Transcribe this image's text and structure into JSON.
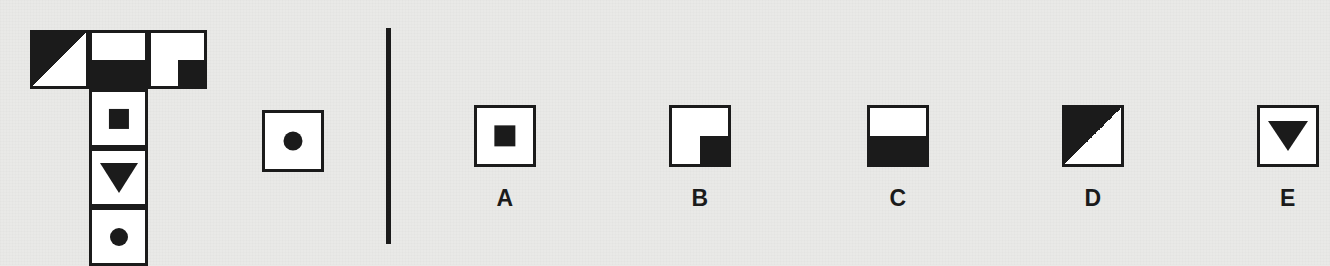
{
  "puzzle": {
    "type": "visual-analogy-matrix",
    "background_color": "#e9e9e7",
    "ink_color": "#1b1b1b",
    "matrix": {
      "shape": "T",
      "top_row": [
        {
          "id": "m-r1c1",
          "fill": "triangle-lower-left",
          "label": "black triangle lower-left"
        },
        {
          "id": "m-r1c2",
          "fill": "bottom-half",
          "label": "bottom half black"
        },
        {
          "id": "m-r1c3",
          "fill": "quadrant-bottom-right",
          "label": "black square bottom-right quadrant"
        }
      ],
      "column": [
        {
          "id": "m-r2c2",
          "fill": "square-center",
          "label": "black square centered"
        },
        {
          "id": "m-r3c2",
          "fill": "triangle-down",
          "label": "black downward triangle"
        },
        {
          "id": "m-r4c2",
          "fill": "circle",
          "label": "black circle"
        }
      ]
    },
    "stimulus": {
      "id": "stimulus",
      "fill": "circle",
      "label": "black circle"
    },
    "divider": {
      "orientation": "vertical"
    },
    "options": [
      {
        "label": "A",
        "fill": "square-center",
        "description": "black square centered"
      },
      {
        "label": "B",
        "fill": "quadrant-bottom-right",
        "description": "black square bottom-right quadrant"
      },
      {
        "label": "C",
        "fill": "bottom-half",
        "description": "bottom half black"
      },
      {
        "label": "D",
        "fill": "triangle-lower-left",
        "description": "black triangle lower-left"
      },
      {
        "label": "E",
        "fill": "triangle-down",
        "description": "black downward triangle"
      }
    ]
  }
}
